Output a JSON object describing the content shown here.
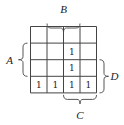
{
  "diagram": {
    "type": "karnaugh-map",
    "rows": 4,
    "cols": 4,
    "cells": [
      [
        "",
        "",
        "",
        ""
      ],
      [
        "",
        "",
        "1",
        ""
      ],
      [
        "",
        "",
        "1",
        ""
      ],
      [
        "1",
        "1",
        "1",
        "1"
      ]
    ],
    "variables": [
      {
        "name": "B",
        "side": "top",
        "span": [
          1,
          2
        ]
      },
      {
        "name": "A",
        "side": "left",
        "span": [
          1,
          2
        ]
      },
      {
        "name": "D",
        "side": "right",
        "span": [
          2,
          3
        ]
      },
      {
        "name": "C",
        "side": "bottom",
        "span": [
          2,
          3
        ]
      }
    ]
  }
}
